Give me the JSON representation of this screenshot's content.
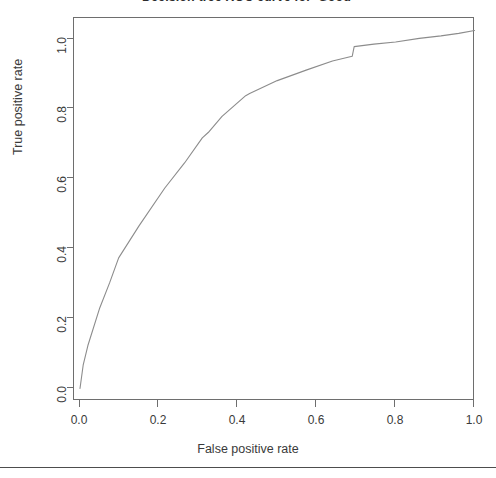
{
  "chart_data": {
    "type": "line",
    "title": "Decision tree ROC curve for 'Good'",
    "xlabel": "False positive rate",
    "ylabel": "True positive rate",
    "xlim": [
      0.0,
      1.0
    ],
    "ylim": [
      0.0,
      1.0
    ],
    "grid": false,
    "legend": null,
    "xticks": [
      "0.0",
      "0.2",
      "0.4",
      "0.6",
      "0.8",
      "1.0"
    ],
    "xtick_values": [
      0.0,
      0.2,
      0.4,
      0.6,
      0.8,
      1.0
    ],
    "yticks": [
      "0.0",
      "0.2",
      "0.4",
      "0.6",
      "0.8",
      "1.0"
    ],
    "ytick_values": [
      0.0,
      0.2,
      0.4,
      0.6,
      0.8,
      1.0
    ],
    "line_color": "#8c8c8c",
    "series": [
      {
        "name": "ROC curve",
        "x": [
          0.0,
          0.008,
          0.02,
          0.05,
          0.075,
          0.098,
          0.15,
          0.215,
          0.265,
          0.31,
          0.325,
          0.36,
          0.42,
          0.43,
          0.5,
          0.575,
          0.64,
          0.69,
          0.695,
          0.745,
          0.8,
          0.86,
          0.915,
          0.96,
          1.0
        ],
        "y": [
          0.0,
          0.065,
          0.12,
          0.225,
          0.295,
          0.365,
          0.455,
          0.56,
          0.63,
          0.7,
          0.715,
          0.76,
          0.818,
          0.824,
          0.86,
          0.89,
          0.915,
          0.928,
          0.955,
          0.962,
          0.968,
          0.978,
          0.985,
          0.992,
          1.0
        ]
      }
    ]
  },
  "axes": {
    "x_title": "False positive rate",
    "y_title": "True positive rate"
  }
}
